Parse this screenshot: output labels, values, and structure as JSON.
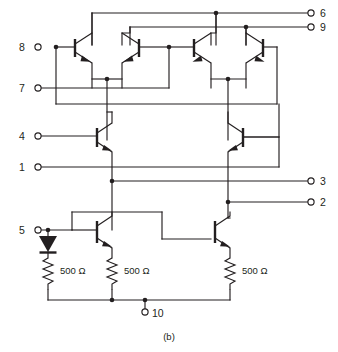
{
  "figure": {
    "caption": "(b)",
    "type": "transistor-circuit-schematic",
    "ink_color": "#231f20",
    "background_color": "#ffffff"
  },
  "pins": {
    "left": [
      {
        "id": "8",
        "label": "8",
        "x": 33,
        "y": 47
      },
      {
        "id": "7",
        "label": "7",
        "x": 33,
        "y": 88
      },
      {
        "id": "4",
        "label": "4",
        "x": 33,
        "y": 136
      },
      {
        "id": "1",
        "label": "1",
        "x": 33,
        "y": 167
      },
      {
        "id": "5",
        "label": "5",
        "x": 33,
        "y": 230
      }
    ],
    "right": [
      {
        "id": "6",
        "label": "6",
        "x": 313,
        "y": 13
      },
      {
        "id": "9",
        "label": "9",
        "x": 313,
        "y": 27
      },
      {
        "id": "3",
        "label": "3",
        "x": 313,
        "y": 181
      },
      {
        "id": "2",
        "label": "2",
        "x": 313,
        "y": 202
      }
    ],
    "bottom": [
      {
        "id": "10",
        "label": "10",
        "x": 145,
        "y": 313
      }
    ]
  },
  "resistors": [
    {
      "id": "R1",
      "label": "500 Ω",
      "x": 44,
      "y": 271
    },
    {
      "id": "R2",
      "label": "500 Ω",
      "x": 113,
      "y": 271
    },
    {
      "id": "R3",
      "label": "500 Ω",
      "x": 218,
      "y": 271
    }
  ],
  "diodes": [
    {
      "id": "D1",
      "x": 44,
      "y": 243,
      "orientation": "down"
    }
  ],
  "transistors": [
    {
      "id": "Q1",
      "type": "npn",
      "facing": "right",
      "x": 78,
      "y": 57
    },
    {
      "id": "Q2",
      "type": "npn",
      "facing": "left",
      "x": 136,
      "y": 57
    },
    {
      "id": "Q3",
      "type": "npn",
      "facing": "right",
      "x": 202,
      "y": 57
    },
    {
      "id": "Q4",
      "type": "npn",
      "facing": "left",
      "x": 260,
      "y": 57
    },
    {
      "id": "Q5",
      "type": "npn",
      "facing": "right",
      "x": 103,
      "y": 140
    },
    {
      "id": "Q6",
      "type": "npn",
      "facing": "left",
      "x": 240,
      "y": 140
    },
    {
      "id": "Q7",
      "type": "npn",
      "facing": "right",
      "x": 100,
      "y": 232
    },
    {
      "id": "Q8",
      "type": "npn",
      "facing": "right",
      "x": 218,
      "y": 232
    }
  ]
}
